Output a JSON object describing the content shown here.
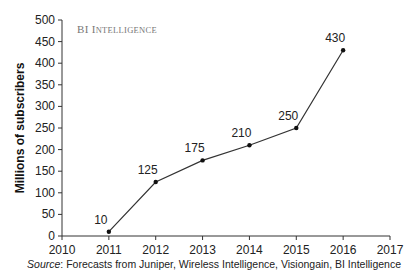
{
  "chart_data": {
    "type": "line",
    "title": "",
    "brand": "BI Intelligence",
    "xlabel": "",
    "ylabel": "Millions of subscribers",
    "x": [
      2011,
      2012,
      2013,
      2014,
      2015,
      2016
    ],
    "series": [
      {
        "name": "Subscribers",
        "values": [
          10,
          125,
          175,
          210,
          250,
          430
        ]
      }
    ],
    "data_labels": [
      "10",
      "125",
      "175",
      "210",
      "250",
      "430"
    ],
    "xlim": [
      2010,
      2017
    ],
    "ylim": [
      0,
      500
    ],
    "xticks": [
      2010,
      2011,
      2012,
      2013,
      2014,
      2015,
      2016,
      2017
    ],
    "yticks": [
      0,
      50,
      100,
      150,
      200,
      250,
      300,
      350,
      400,
      450,
      500
    ],
    "grid": false,
    "source_prefix": "Source",
    "source_text": ": Forecasts from Juniper, Wireless Intelligence, Visiongain, BI Intelligence"
  }
}
